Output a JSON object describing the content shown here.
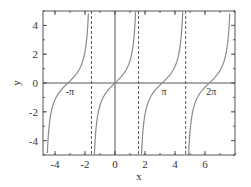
{
  "chart_data": {
    "type": "line",
    "title": "",
    "function": "tan(x)",
    "xlabel": "x",
    "ylabel": "y",
    "xlim": [
      -4.8,
      8.0
    ],
    "ylim": [
      -5,
      5
    ],
    "grid": false,
    "legend": null,
    "x_ticks": [
      -4,
      -2,
      0,
      2,
      4,
      6
    ],
    "x_tick_labels": [
      "-4",
      "-2",
      "0",
      "2",
      "4",
      "6"
    ],
    "y_ticks": [
      -4,
      -2,
      0,
      2,
      4
    ],
    "y_tick_labels": [
      "-4",
      "-2",
      "0",
      "2",
      "4"
    ],
    "minor_tick_step": 1,
    "asymptotes": [
      -1.5708,
      1.5708,
      4.7124
    ],
    "asymptote_style": "dashed",
    "reference_lines": {
      "x": 0,
      "y": 0
    },
    "annotations": [
      {
        "text": "-π",
        "x": -3.1416,
        "y": 0
      },
      {
        "text": "π",
        "x": 3.1416,
        "y": 0
      },
      {
        "text": "2π",
        "x": 6.2832,
        "y": 0
      }
    ],
    "series": [
      {
        "name": "tan(x)",
        "color": "#8a8a8a",
        "x": [
          -4.712,
          -4.6,
          -4.4,
          -4.2,
          -4.0,
          -3.8,
          -3.6,
          -3.4,
          -3.1416,
          -2.9,
          -2.6,
          -2.3,
          -2.0,
          -1.8,
          -1.68,
          -1.5708,
          -1.5708,
          -1.45,
          -1.3,
          -1.1,
          -0.8,
          -0.5,
          0,
          0.5,
          0.8,
          1.1,
          1.3,
          1.45,
          1.5708,
          1.5708,
          1.69,
          1.8,
          2.0,
          2.3,
          2.6,
          3.1416,
          3.5,
          3.8,
          4.1,
          4.3,
          4.5,
          4.6,
          4.7124,
          4.7124,
          4.83,
          4.95,
          5.2,
          5.5,
          5.8,
          6.2832,
          6.6,
          7.0,
          7.4,
          7.7,
          8.0
        ],
        "y_range_note": "tan(x), clipped to ylim"
      }
    ],
    "colors": {
      "curve": "#8a8a8a",
      "axes": "#555555",
      "asymptote": "#555555",
      "text": "#333333"
    }
  }
}
